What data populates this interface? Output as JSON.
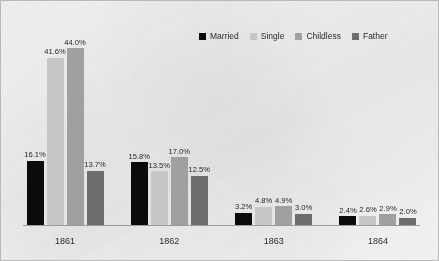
{
  "chart_data": {
    "type": "bar",
    "title": "",
    "subtitle": "",
    "xlabel": "",
    "ylabel": "",
    "ylim": [
      0,
      50
    ],
    "grid": false,
    "legend_position": "top-right",
    "value_suffix": "%",
    "categories": [
      "1861",
      "1862",
      "1863",
      "1864"
    ],
    "series": [
      {
        "name": "Married",
        "color": "#0b0b0b",
        "values": [
          16.1,
          15.8,
          3.2,
          2.4
        ],
        "labels": [
          "16.1%",
          "15.8%",
          "3.2%",
          "2.4%"
        ]
      },
      {
        "name": "Single",
        "color": "#c6c6c4",
        "values": [
          41.6,
          13.5,
          4.8,
          2.6
        ],
        "labels": [
          "41.6%",
          "13.5%",
          "4.8%",
          "2.6%"
        ]
      },
      {
        "name": "Childless",
        "color": "#a0a09e",
        "values": [
          44.0,
          17.0,
          4.9,
          2.9
        ],
        "labels": [
          "44.0%",
          "17.0%",
          "4.9%",
          "2.9%"
        ]
      },
      {
        "name": "Father",
        "color": "#6d6d6b",
        "values": [
          13.7,
          12.5,
          3.0,
          2.0
        ],
        "labels": [
          "13.7%",
          "12.5%",
          "3.0%",
          "2.0%"
        ]
      }
    ]
  },
  "legend": {
    "entries": [
      {
        "label": "Married",
        "color": "#0b0b0b"
      },
      {
        "label": "Single",
        "color": "#c6c6c4"
      },
      {
        "label": "Childless",
        "color": "#a0a09e"
      },
      {
        "label": "Father",
        "color": "#6d6d6b"
      }
    ]
  },
  "frame": {
    "background": "#f4f4f2",
    "border_color": "#b9b9b7",
    "axis_color": "#9a9a98",
    "text_color": "#2b2b2b"
  }
}
